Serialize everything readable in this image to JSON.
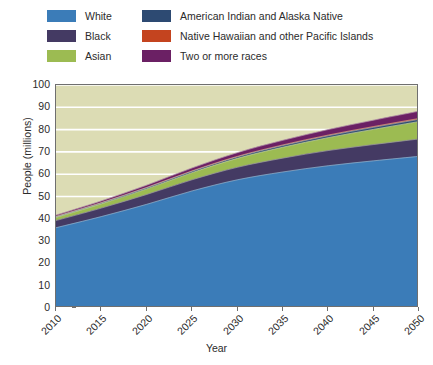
{
  "chart_data": {
    "type": "area",
    "title": "",
    "subtitle": "",
    "xlabel": "Year",
    "ylabel": "People (millions)",
    "stacked": true,
    "grid": true,
    "grid_color": "#ffffff",
    "plot_background": "#dcdcb4",
    "legend_position": "top",
    "x": [
      2010,
      2015,
      2020,
      2025,
      2030,
      2035,
      2040,
      2045,
      2050
    ],
    "xlim": [
      2010,
      2050
    ],
    "ylim": [
      0,
      100
    ],
    "ytick_labels": [
      "0",
      "10",
      "20",
      "30",
      "40",
      "50",
      "60",
      "70",
      "80",
      "90",
      "100"
    ],
    "yticks": [
      0,
      10,
      20,
      30,
      40,
      50,
      60,
      70,
      80,
      90,
      100
    ],
    "xtick_labels": [
      "2010",
      "2015",
      "2020",
      "2025",
      "2030",
      "2035",
      "2040",
      "2045",
      "2050"
    ],
    "series": [
      {
        "name": "White",
        "color": "#3b7cb8",
        "values": [
          36.0,
          41.0,
          46.5,
          52.5,
          57.5,
          61.0,
          63.8,
          66.0,
          68.0
        ]
      },
      {
        "name": "Black",
        "color": "#443a63",
        "values": [
          3.2,
          3.8,
          4.4,
          5.0,
          5.6,
          6.2,
          6.8,
          7.3,
          7.8
        ]
      },
      {
        "name": "Asian",
        "color": "#9cbb52",
        "values": [
          1.4,
          1.9,
          2.5,
          3.2,
          4.0,
          4.9,
          5.8,
          6.8,
          7.8
        ]
      },
      {
        "name": "American Indian and Alaska Native",
        "color": "#2d4a72",
        "values": [
          0.35,
          0.42,
          0.5,
          0.58,
          0.66,
          0.74,
          0.82,
          0.9,
          0.98
        ]
      },
      {
        "name": "Native Hawaiian and other Pacific Islands",
        "color": "#c4441f",
        "values": [
          0.12,
          0.15,
          0.18,
          0.22,
          0.26,
          0.3,
          0.34,
          0.38,
          0.42
        ]
      },
      {
        "name": "Two or more races",
        "color": "#6b2064",
        "values": [
          0.55,
          0.75,
          1.0,
          1.3,
          1.65,
          2.05,
          2.45,
          2.85,
          3.25
        ]
      }
    ],
    "totals": [
      41.6,
      48.0,
      55.1,
      62.8,
      69.7,
      75.2,
      80.0,
      84.2,
      88.2
    ]
  },
  "legend": {
    "rows": [
      {
        "left": {
          "label": "White",
          "color": "#3b7cb8"
        },
        "right": {
          "label": "American Indian and Alaska Native",
          "color": "#2d4a72"
        }
      },
      {
        "left": {
          "label": "Black",
          "color": "#443a63"
        },
        "right": {
          "label": "Native Hawaiian and other Pacific Islands",
          "color": "#c4441f"
        }
      },
      {
        "left": {
          "label": "Asian",
          "color": "#9cbb52"
        },
        "right": {
          "label": "Two or more races",
          "color": "#6b2064"
        }
      }
    ]
  }
}
